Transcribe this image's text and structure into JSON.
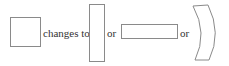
{
  "diagram": {
    "labels": {
      "changes_to": "changes to",
      "or_1": "or",
      "or_2": "or"
    },
    "shapes": [
      {
        "name": "square",
        "description": "original square"
      },
      {
        "name": "tall-rectangle",
        "description": "vertically stretched rectangle"
      },
      {
        "name": "wide-rectangle",
        "description": "horizontally stretched rectangle"
      },
      {
        "name": "curved-shape",
        "description": "bent / curved quadrilateral"
      }
    ],
    "stroke_color": "#8a8a8a"
  }
}
